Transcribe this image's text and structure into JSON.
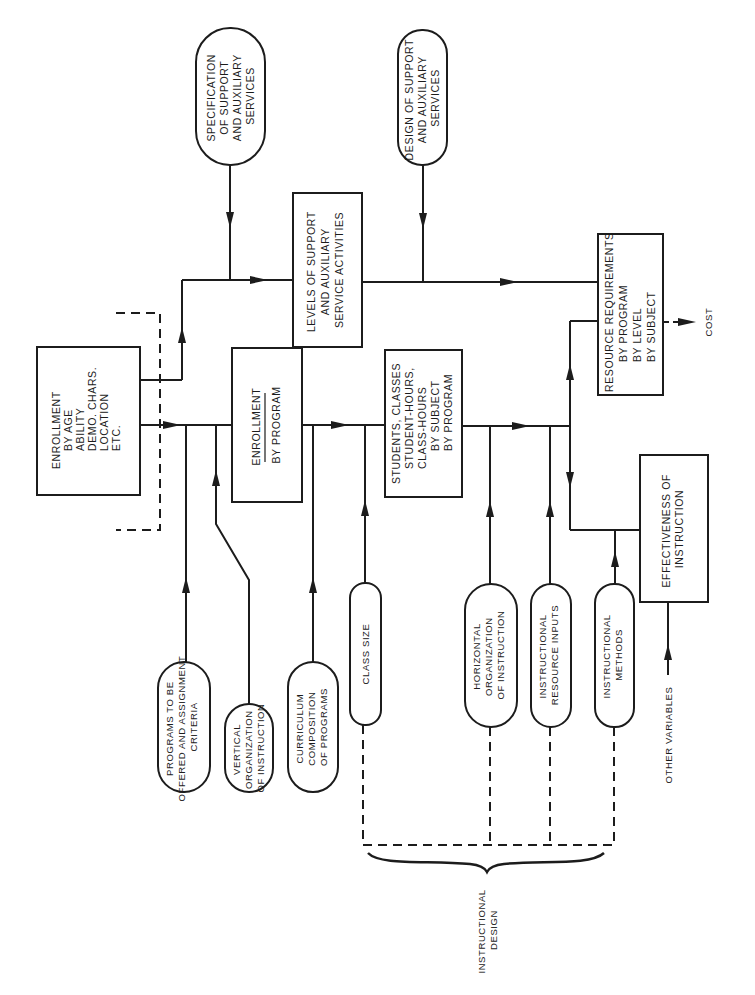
{
  "diagram": {
    "orientation": "rotated-90-ccw",
    "nodes": {
      "spec_support": {
        "type": "oval",
        "lines": [
          "SPECIFICATION",
          "OF SUPPORT",
          "AND AUXILIARY",
          "SERVICES"
        ]
      },
      "design_support": {
        "type": "oval",
        "lines": [
          "DESIGN OF SUPPORT",
          "AND AUXILIARY",
          "SERVICES"
        ]
      },
      "levels_support": {
        "type": "box",
        "lines": [
          "LEVELS OF SUPPORT",
          "AND AUXILIARY",
          "SERVICE ACTIVITIES"
        ]
      },
      "resource_req": {
        "type": "box",
        "lines": [
          "RESOURCE REQUIREMENTS",
          "BY PROGRAM",
          "BY LEVEL",
          "BY SUBJECT"
        ]
      },
      "cost": {
        "type": "label",
        "text": "COST"
      },
      "enroll_age": {
        "type": "box",
        "lines": [
          "ENROLLMENT",
          "BY AGE",
          "ABILITY",
          "DEMO. CHARS.",
          "LOCATION",
          "ETC."
        ]
      },
      "enroll_program": {
        "type": "box",
        "lines": [
          "ENROLLMENT",
          "BY PROGRAM"
        ]
      },
      "students_classes": {
        "type": "box",
        "lines": [
          "STUDENTS, CLASSES",
          "STUDENT-HOURS,",
          "CLASS-HOURS",
          "BY SUBJECT",
          "BY PROGRAM"
        ]
      },
      "effectiveness": {
        "type": "box",
        "lines": [
          "EFFECTIVENESS OF",
          "INSTRUCTION"
        ]
      },
      "programs_offered": {
        "type": "oval",
        "lines": [
          "PROGRAMS TO BE",
          "OFFERED AND ASSIGNMENT",
          "CRITERIA"
        ]
      },
      "vertical_org": {
        "type": "oval",
        "lines": [
          "VERTICAL",
          "ORGANIZATION",
          "OF INSTRUCTION"
        ]
      },
      "curriculum": {
        "type": "oval",
        "lines": [
          "CURRICULUM",
          "COMPOSITION",
          "OF PROGRAMS"
        ]
      },
      "class_size": {
        "type": "oval",
        "lines": [
          "CLASS SIZE"
        ]
      },
      "horizontal_org": {
        "type": "oval",
        "lines": [
          "HORIZONTAL",
          "ORGANIZATION",
          "OF INSTRUCTION"
        ]
      },
      "instr_resource": {
        "type": "oval",
        "lines": [
          "INSTRUCTIONAL",
          "RESOURCE INPUTS"
        ]
      },
      "instr_methods": {
        "type": "oval",
        "lines": [
          "INSTRUCTIONAL",
          "METHODS"
        ]
      },
      "other_variables": {
        "type": "label",
        "text": "OTHER VARIABLES"
      },
      "instructional_design": {
        "type": "brace-label",
        "lines": [
          "INSTRUCTIONAL",
          "DESIGN"
        ]
      }
    },
    "edges": [
      [
        "enroll_age",
        "enroll_program"
      ],
      [
        "enroll_age",
        "levels_support"
      ],
      [
        "spec_support",
        "levels_support"
      ],
      [
        "levels_support",
        "resource_req"
      ],
      [
        "design_support",
        "resource_req"
      ],
      [
        "programs_offered",
        "enroll_program"
      ],
      [
        "vertical_org",
        "enroll_program"
      ],
      [
        "enroll_program",
        "students_classes"
      ],
      [
        "curriculum",
        "students_classes"
      ],
      [
        "class_size",
        "students_classes"
      ],
      [
        "students_classes",
        "resource_req"
      ],
      [
        "students_classes",
        "effectiveness"
      ],
      [
        "horizontal_org",
        "resource_req"
      ],
      [
        "instr_resource",
        "resource_req"
      ],
      [
        "instr_methods",
        "effectiveness"
      ],
      [
        "effectiveness",
        "resource_req"
      ],
      [
        "other_variables",
        "effectiveness"
      ],
      [
        "resource_req",
        "cost"
      ]
    ],
    "colors": {
      "ink": "#1c1c1c",
      "paper": "#ffffff"
    }
  }
}
